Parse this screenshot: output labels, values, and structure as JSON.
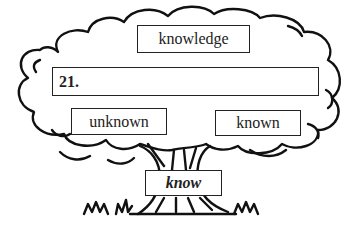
{
  "diagram": {
    "type": "word-family-tree",
    "top_word": "knowledge",
    "answer_blank": {
      "number": "21.",
      "value": ""
    },
    "left_word": "unknown",
    "right_word": "known",
    "root_word": "know"
  }
}
